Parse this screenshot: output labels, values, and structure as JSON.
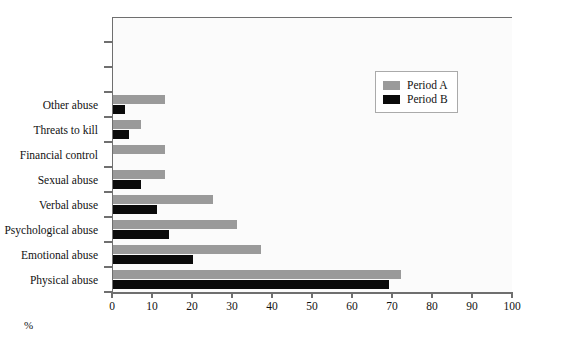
{
  "chart_data": {
    "type": "bar",
    "orientation": "horizontal",
    "title": "",
    "xlabel": "%",
    "ylabel": "",
    "xlim": [
      0,
      100
    ],
    "xticks": [
      0,
      10,
      20,
      30,
      40,
      50,
      60,
      70,
      80,
      90,
      100
    ],
    "grid": false,
    "legend_position": "upper right",
    "categories": [
      "Physical abuse",
      "Emotional abuse",
      "Psychological abuse",
      "Verbal abuse",
      "Sexual abuse",
      "Financial control",
      "Threats to kill",
      "Other abuse",
      "",
      "",
      ""
    ],
    "series": [
      {
        "name": "Period A",
        "color": "#9a9a9a",
        "values": [
          72,
          37,
          31,
          25,
          13,
          13,
          7,
          13,
          null,
          null,
          null
        ]
      },
      {
        "name": "Period B",
        "color": "#0a0a0a",
        "values": [
          69,
          20,
          14,
          11,
          7,
          null,
          4,
          3,
          null,
          null,
          null
        ]
      }
    ]
  },
  "legend": {
    "entries": [
      {
        "label": "Period A",
        "swatch": "a"
      },
      {
        "label": "Period B",
        "swatch": "b"
      }
    ]
  },
  "axis": {
    "x_title": "%"
  },
  "colors": {
    "period_a": "#9a9a9a",
    "period_b": "#0a0a0a",
    "axis": "#6f6f6f",
    "plot_background": "#fbfbfb"
  }
}
